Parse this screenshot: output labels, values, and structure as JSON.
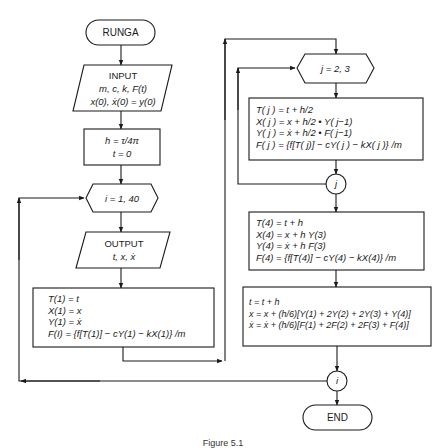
{
  "flowchart": {
    "start": {
      "label": "RUNGA"
    },
    "input": {
      "title": "INPUT",
      "line1": "m, c, k, F(t)",
      "line2": "x(0), ẋ(0) = y(0)"
    },
    "init": {
      "line1": "h = τ/4π",
      "line2": "t = 0"
    },
    "outer_loop": {
      "label": "i = 1, 40",
      "connector": "i"
    },
    "output": {
      "title": "OUTPUT",
      "line1": "t, x, ẋ"
    },
    "step1": {
      "lines": [
        "T(1) = t",
        "X(1) = x",
        "Y(1) = ẋ",
        "F(I) = {f[T(1)] − cY(1) − kX(1)} /m"
      ]
    },
    "inner_loop": {
      "label": "j = 2, 3",
      "connector": "j"
    },
    "step_j": {
      "lines": [
        "T( j ) = t + h/2",
        "X( j ) = x + h/2 • Y( j−1)",
        "Y( j ) = ẋ + h/2 • F( j−1)",
        "F( j ) = {f[T( j)] − cY( j ) − kX( j )} /m"
      ]
    },
    "step4": {
      "lines": [
        "T(4) = t + h",
        "X(4) = x + h Y(3)",
        "Y(4) = ẋ + h F(3)",
        "F(4) = {f[T(4)] − cY(4) − kX(4)} /m"
      ]
    },
    "update": {
      "lines": [
        "t = t + h",
        "x = x + (h/6)[Y(1) + 2Y(2) + 2Y(3) + Y(4)]",
        "ẋ = ẋ + (h/6)[F(1) + 2F(2) + 2F(3) + F(4)]"
      ]
    },
    "end": {
      "label": "END"
    }
  },
  "caption": "Figure 5.1"
}
